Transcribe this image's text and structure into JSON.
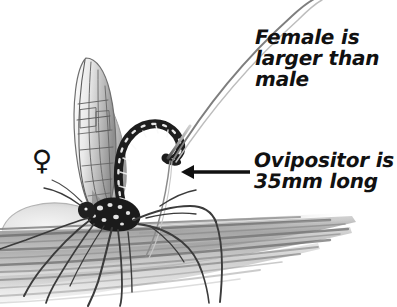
{
  "figure": {
    "kind": "hand-drawn pencil illustration",
    "background_color": "#ffffff",
    "ink_color": "#111111",
    "width": 397,
    "height": 307
  },
  "annotations": {
    "female_label": {
      "lines": [
        "Female is",
        "larger than",
        "male"
      ],
      "line1": "Female is",
      "line2": "larger than",
      "line3": "male"
    },
    "ovipositor_label": {
      "lines": [
        "Ovipositor is",
        "35mm long"
      ],
      "line1": "Ovipositor is",
      "line2": "35mm long",
      "measurement": "35mm"
    },
    "sex_symbol": {
      "glyph": "♀",
      "meaning": "female"
    }
  },
  "pointer": {
    "arrow_label": "leader arrow pointing to ovipositor base",
    "direction": "left",
    "tip_x": 181,
    "tip_y": 172,
    "tail_x": 250,
    "tail_y": 172
  },
  "drawing_parts": [
    "folded wings",
    "banded arched abdomen",
    "thorax",
    "long thin legs",
    "ovipositor",
    "bark substrate hatching"
  ]
}
